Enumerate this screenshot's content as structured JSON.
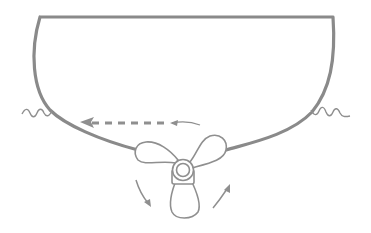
{
  "diagram": {
    "colors": {
      "hull_stroke": "#8a8a8a",
      "line_stroke": "#8f8f8f",
      "background": "#ffffff"
    },
    "elements": [
      {
        "name": "hull",
        "description": "Cross-section of boat hull, flat deck on top, rounded bottom"
      },
      {
        "name": "waterline-left",
        "description": "Wavy water surface line on left side"
      },
      {
        "name": "waterline-right",
        "description": "Wavy water surface line on right side"
      },
      {
        "name": "propeller",
        "description": "Three-blade propeller at keel, viewed from stern"
      },
      {
        "name": "rotation-arrows",
        "description": "Two curved arrows indicating propeller rotation"
      },
      {
        "name": "side-thrust-arrow",
        "description": "Dashed arrow pointing left indicating lateral (paddle-wheel) effect"
      }
    ]
  }
}
